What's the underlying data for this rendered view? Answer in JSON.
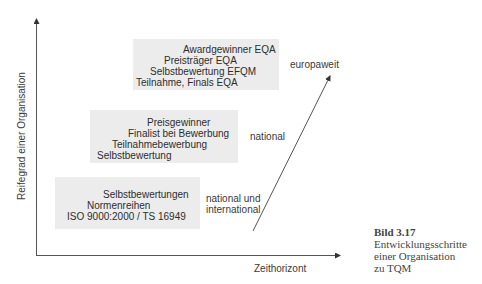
{
  "diagram": {
    "y_axis_label": "Reifegrad einer Organisation",
    "x_axis_label": "Zeithorizont",
    "stages": [
      {
        "scope": "europaweit",
        "lines": [
          "Awardgewinner EQA",
          "Preisträger EQA",
          "Selbstbewertung EFQM",
          "Teilnahme, Finals EQA"
        ]
      },
      {
        "scope": "national",
        "lines": [
          "Preisgewinner",
          "Finalist bei Bewerbung",
          "Teilnahmebewerbung",
          "Selbstbewertung"
        ]
      },
      {
        "scope_lines": [
          "national und",
          "international"
        ],
        "lines": [
          "Selbstbewertungen",
          "Normenreihen",
          "ISO 9000:2000 / TS 16949"
        ]
      }
    ],
    "colors": {
      "box_fill": "#ececec",
      "axis": "#444444",
      "text": "#333333"
    }
  },
  "caption": {
    "title": "Bild 3.17",
    "lines": [
      "Entwicklungsschritte",
      "einer Organisation",
      "zu TQM"
    ]
  }
}
